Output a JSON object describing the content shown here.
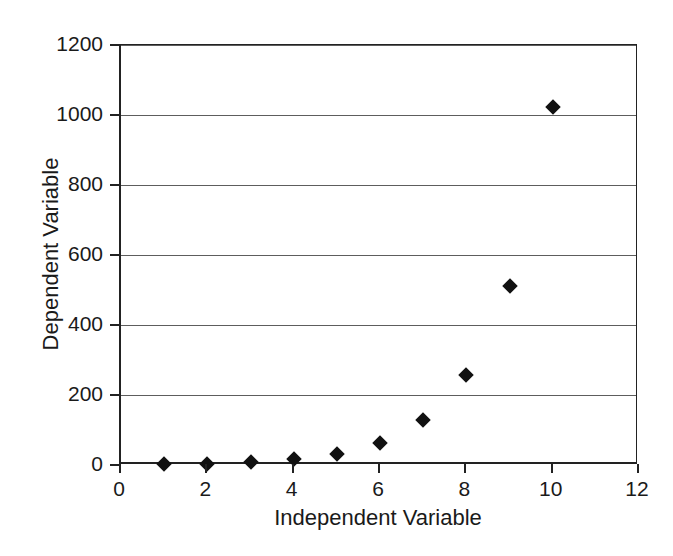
{
  "chart_data": {
    "type": "scatter",
    "title": "",
    "xlabel": "Independent Variable",
    "ylabel": "Dependent Variable",
    "xlim": [
      0,
      12
    ],
    "ylim": [
      0,
      1200
    ],
    "grid": true,
    "legend": "none",
    "marker": "filled-diamond",
    "marker_color": "#111111",
    "x": [
      1,
      2,
      3,
      4,
      5,
      6,
      7,
      8,
      9,
      10
    ],
    "y": [
      2,
      4,
      8,
      16,
      32,
      64,
      128,
      256,
      512,
      1024
    ],
    "series": [
      {
        "name": "Dependent Variable",
        "values": [
          2,
          4,
          8,
          16,
          32,
          64,
          128,
          256,
          512,
          1024
        ]
      }
    ],
    "xticks": [
      {
        "value": 0,
        "label": "0"
      },
      {
        "value": 2,
        "label": "2"
      },
      {
        "value": 4,
        "label": "4"
      },
      {
        "value": 6,
        "label": "6"
      },
      {
        "value": 8,
        "label": "8"
      },
      {
        "value": 10,
        "label": "10"
      },
      {
        "value": 12,
        "label": "12"
      }
    ],
    "yticks": [
      {
        "value": 0,
        "label": "0"
      },
      {
        "value": 200,
        "label": "200"
      },
      {
        "value": 400,
        "label": "400"
      },
      {
        "value": 600,
        "label": "600"
      },
      {
        "value": 800,
        "label": "800"
      },
      {
        "value": 1000,
        "label": "1000"
      },
      {
        "value": 1200,
        "label": "1200"
      }
    ],
    "gridlines_y": [
      200,
      400,
      600,
      800,
      1000,
      1200
    ],
    "colors": {
      "background": "#ffffff",
      "axis": "#222222",
      "gridline": "#5d5d5d",
      "marker": "#111111",
      "text": "#1a1a1a"
    }
  }
}
